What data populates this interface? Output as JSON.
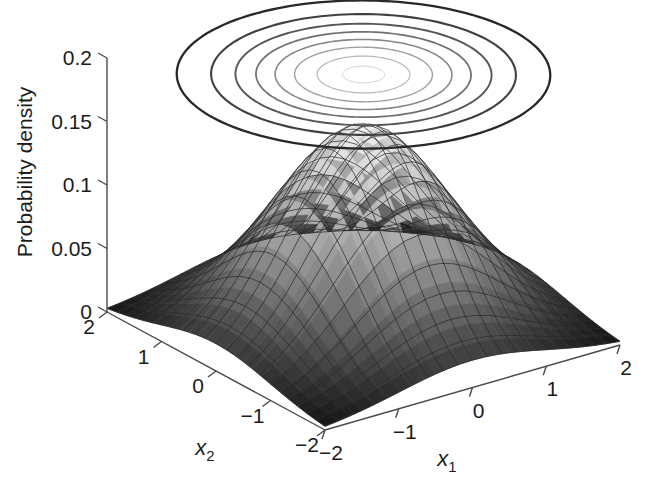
{
  "figure": {
    "kind": "matlab-3d-surface-with-contour",
    "background_color": "#ffffff",
    "axis_color": "#4a4a4a",
    "text_color": "#1b1b1b",
    "surface_low_color": "#0d0d0d",
    "surface_high_color": "#f2f2f2",
    "contour_color": "#3a3a3a"
  },
  "chart_data": {
    "type": "surface",
    "title": "",
    "subtitle": "",
    "zlabel": "Probability density",
    "xlabel": "x_1",
    "ylabel": "x_2",
    "x1_label_base": "x",
    "x1_label_sub": "1",
    "x2_label_base": "x",
    "x2_label_sub": "2",
    "zticks": [
      0,
      0.05,
      0.1,
      0.15,
      0.2
    ],
    "ztick_labels": [
      "0",
      "0.05",
      "0.1",
      "0.15",
      "0.2"
    ],
    "zlim": [
      0,
      0.2
    ],
    "x1ticks": [
      -2,
      -1,
      0,
      1,
      2
    ],
    "x1tick_labels": [
      "−2",
      "−1",
      "0",
      "1",
      "2"
    ],
    "x1lim": [
      -2,
      2
    ],
    "x2ticks": [
      2,
      1,
      0,
      -1,
      -2
    ],
    "x2tick_labels": [
      "2",
      "1",
      "0",
      "−1",
      "−2"
    ],
    "x2lim": [
      -2,
      2
    ],
    "grid": false,
    "legend": null,
    "distribution": {
      "name": "bivariate gaussian",
      "mean": [
        0,
        0
      ],
      "sigma_x1": 1.0,
      "sigma_x2": 1.0,
      "correlation": 0.0,
      "peak_density": 0.159
    },
    "contour_levels": [
      0.02,
      0.04,
      0.06,
      0.08,
      0.1,
      0.12,
      0.14,
      0.155
    ],
    "contour_count": 8,
    "contour_plane_z": 0.2,
    "mesh_divisions": 24,
    "surface_samples": {
      "x1": [
        -2.0,
        -1.5,
        -1.0,
        -0.5,
        0.0,
        0.5,
        1.0,
        1.5,
        2.0
      ],
      "x2": [
        -2.0,
        -1.5,
        -1.0,
        -0.5,
        0.0,
        0.5,
        1.0,
        1.5,
        2.0
      ],
      "z": [
        [
          0.0029,
          0.0067,
          0.0122,
          0.0166,
          0.0183,
          0.0166,
          0.0122,
          0.0067,
          0.0029
        ],
        [
          0.0067,
          0.0154,
          0.0281,
          0.0381,
          0.042,
          0.0381,
          0.0281,
          0.0154,
          0.0067
        ],
        [
          0.0122,
          0.0281,
          0.0513,
          0.0695,
          0.0767,
          0.0695,
          0.0513,
          0.0281,
          0.0122
        ],
        [
          0.0166,
          0.0381,
          0.0695,
          0.0942,
          0.104,
          0.0942,
          0.0695,
          0.0381,
          0.0166
        ],
        [
          0.0183,
          0.042,
          0.0767,
          0.104,
          0.1149,
          0.104,
          0.0767,
          0.042,
          0.0183
        ],
        [
          0.0166,
          0.0381,
          0.0695,
          0.0942,
          0.104,
          0.0942,
          0.0695,
          0.0381,
          0.0166
        ],
        [
          0.0122,
          0.0281,
          0.0513,
          0.0695,
          0.0767,
          0.0695,
          0.0513,
          0.0281,
          0.0122
        ],
        [
          0.0067,
          0.0154,
          0.0281,
          0.0381,
          0.042,
          0.0381,
          0.0281,
          0.0154,
          0.0067
        ],
        [
          0.0029,
          0.0067,
          0.0122,
          0.0166,
          0.0183,
          0.0166,
          0.0122,
          0.0067,
          0.0029
        ]
      ]
    }
  }
}
